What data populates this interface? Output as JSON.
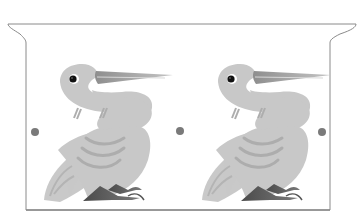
{
  "scene": {
    "description": "Grayscale illustration of two stylized birds with long beaks, standing side by side inside a rectangular panel with flared top corners",
    "bird_count": 2,
    "dot_count": 3
  },
  "colors": {
    "background": "#ffffff",
    "frame_stroke": "#8a8a8a",
    "bird_body": "#c8c8c8",
    "bird_shade": "#b0b0b0",
    "beak": "#a8a8a8",
    "feet": "#606060",
    "eye": "#111111",
    "dot": "#7a7a7a"
  }
}
